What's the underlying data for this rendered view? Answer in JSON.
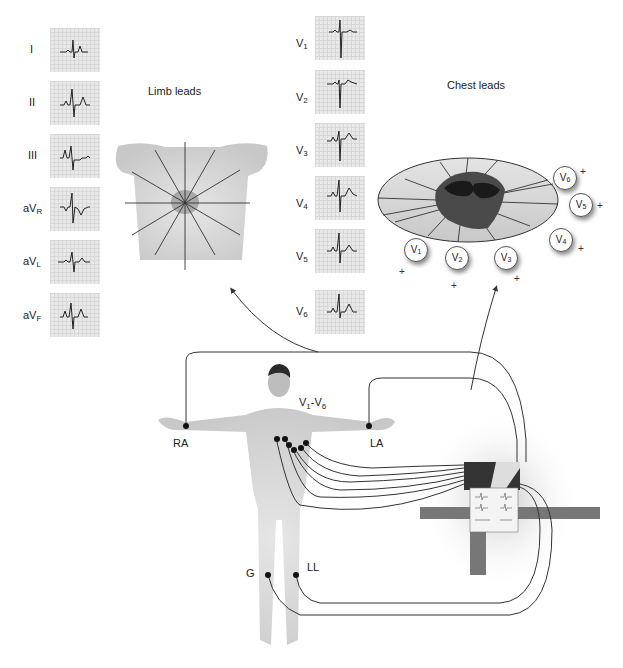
{
  "titles": {
    "limb": "Limb leads",
    "chest": "Chest leads"
  },
  "limb_leads": [
    {
      "id": "I",
      "label": "I",
      "sub": ""
    },
    {
      "id": "II",
      "label": "II",
      "sub": ""
    },
    {
      "id": "III",
      "label": "III",
      "sub": ""
    },
    {
      "id": "aVR",
      "label": "aV",
      "sub": "R"
    },
    {
      "id": "aVL",
      "label": "aV",
      "sub": "L"
    },
    {
      "id": "aVF",
      "label": "aV",
      "sub": "F"
    }
  ],
  "chest_leads": [
    {
      "id": "V1",
      "label": "V",
      "sub": "1"
    },
    {
      "id": "V2",
      "label": "V",
      "sub": "2"
    },
    {
      "id": "V3",
      "label": "V",
      "sub": "3"
    },
    {
      "id": "V4",
      "label": "V",
      "sub": "4"
    },
    {
      "id": "V5",
      "label": "V",
      "sub": "5"
    },
    {
      "id": "V6",
      "label": "V",
      "sub": "6"
    }
  ],
  "chest_badges": [
    {
      "label": "V",
      "sub": "1"
    },
    {
      "label": "V",
      "sub": "2"
    },
    {
      "label": "V",
      "sub": "3"
    },
    {
      "label": "V",
      "sub": "4"
    },
    {
      "label": "V",
      "sub": "5"
    },
    {
      "label": "V",
      "sub": "6"
    }
  ],
  "plus_sign": "+",
  "electrodes": {
    "ra": "RA",
    "la": "LA",
    "ll": "LL",
    "g": "G",
    "chest_main": "V",
    "chest_sub1": "1",
    "chest_dash": "-V",
    "chest_sub2": "6"
  },
  "colors": {
    "line": "#333333",
    "tile_bg": "#e9e9e9",
    "skin": "#d4d4d4",
    "heart": "#8a8a8a"
  }
}
